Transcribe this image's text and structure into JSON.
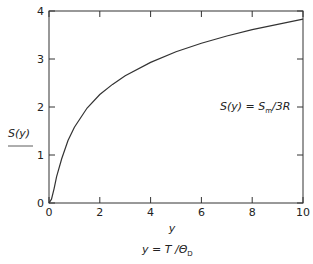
{
  "chart_data": {
    "type": "line",
    "title": "",
    "xlabel": "y",
    "xlabel_definition": "y = T / Θ_D",
    "ylabel": "S(y)",
    "annotation": "S(y) = S_m / 3R",
    "xlim": [
      0,
      10
    ],
    "ylim": [
      0,
      4
    ],
    "xticks": [
      0,
      2,
      4,
      6,
      8,
      10
    ],
    "yticks": [
      0,
      1,
      2,
      3,
      4
    ],
    "grid": false,
    "legend": "none",
    "series": [
      {
        "name": "S(y)",
        "x": [
          0,
          0.1,
          0.2,
          0.3,
          0.5,
          0.75,
          1,
          1.5,
          2,
          2.5,
          3,
          4,
          5,
          6,
          7,
          8,
          9,
          10
        ],
        "values": [
          0,
          0.08,
          0.3,
          0.55,
          0.92,
          1.3,
          1.58,
          1.98,
          2.26,
          2.47,
          2.65,
          2.93,
          3.15,
          3.33,
          3.48,
          3.61,
          3.72,
          3.83
        ]
      }
    ]
  },
  "labels": {
    "ylabel_main": "S(y)",
    "xlabel_main": "y",
    "xdef_prefix": "y = T /Θ",
    "xdef_sub": "D",
    "annot_prefix": "S(y) = S",
    "annot_sub": "m",
    "annot_suffix": "/3R"
  }
}
